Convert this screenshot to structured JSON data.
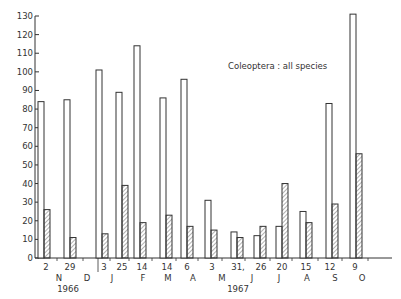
{
  "chart_data": {
    "type": "bar",
    "title": "Coleoptera : all species",
    "xlabel": "",
    "ylabel": "",
    "ylim": [
      0,
      130
    ],
    "yticks": [
      0,
      10,
      20,
      30,
      40,
      50,
      60,
      70,
      80,
      90,
      100,
      110,
      120,
      130
    ],
    "grid": false,
    "legend": "none",
    "categories": [
      "2 N 1966",
      "29 N 1966",
      "3 J 1967",
      "25 J 1967",
      "14 F 1967",
      "14 M 1967",
      "6 A 1967",
      "3 M 1967",
      "31 M 1967",
      "26 J 1967",
      "20 J 1967",
      "15 A 1967",
      "12 S 1967",
      "9 O 1967"
    ],
    "day_labels": [
      "2",
      "29",
      "3",
      "25",
      "14",
      "14",
      "6",
      "3",
      "31,",
      "26",
      "20",
      "15",
      "12",
      "9"
    ],
    "month_labels": [
      "N",
      "D",
      "J",
      "F",
      "M",
      "A",
      "M",
      "J",
      "J",
      "A",
      "S",
      "O"
    ],
    "year_labels": [
      "1966",
      "1967"
    ],
    "series": [
      {
        "name": "open",
        "style": "open",
        "values": [
          84,
          85,
          101,
          89,
          114,
          86,
          96,
          31,
          14,
          12,
          17,
          25,
          83,
          131
        ]
      },
      {
        "name": "hatched",
        "style": "hatched",
        "values": [
          26,
          11,
          13,
          39,
          19,
          23,
          17,
          15,
          11,
          17,
          40,
          19,
          29,
          56
        ]
      }
    ]
  },
  "layout": {
    "bar_x": [
      38,
      64,
      96,
      116,
      134,
      160,
      181,
      205,
      231,
      254,
      276,
      300,
      326,
      350
    ],
    "day_x": [
      46,
      70,
      104,
      122,
      142,
      167,
      187,
      212,
      238,
      261,
      282,
      306,
      330,
      355
    ],
    "month_x": [
      59,
      87,
      112,
      143,
      168,
      193,
      222,
      252,
      279,
      307,
      335,
      362
    ],
    "year_x": [
      68,
      238
    ]
  }
}
